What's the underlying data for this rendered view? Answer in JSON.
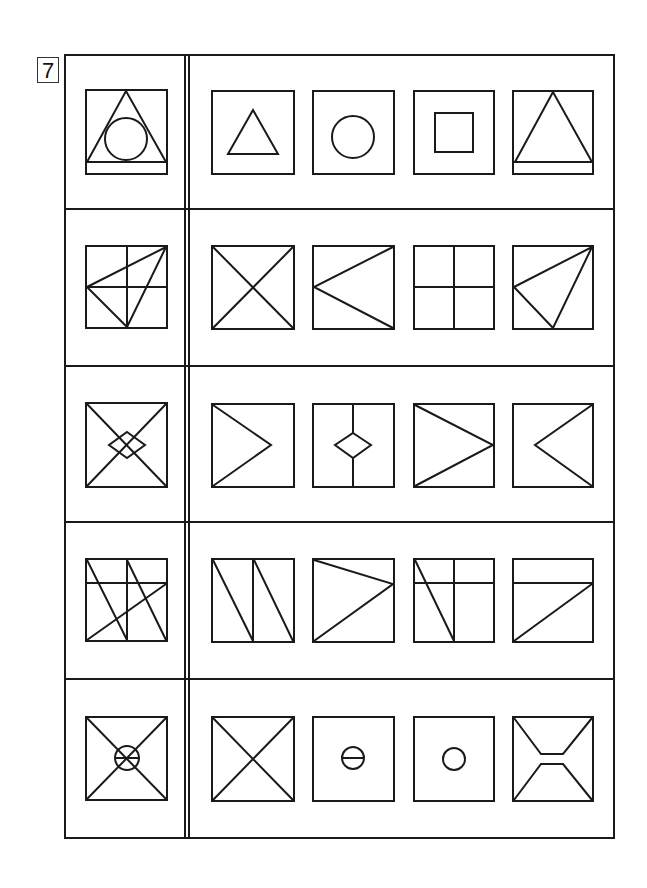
{
  "problem_number": "7",
  "layout": {
    "frame": {
      "x": 65,
      "y": 55,
      "w": 549,
      "h": 783
    },
    "divider_x": [
      185,
      189
    ],
    "row_tops": [
      55,
      209,
      366,
      522,
      679,
      838
    ],
    "stroke_color": "#1a1a1a"
  },
  "rows": [
    {
      "label": "row-1",
      "question": "triangle-with-inscribed-circle-and-base-strip",
      "options": [
        "small-triangle",
        "circle",
        "inner-square",
        "large-triangle-with-base-strip"
      ]
    },
    {
      "label": "row-2",
      "question": "quadrants-with-triangle-right-top-left-mid-bottom-mid",
      "options": [
        "diagonal-x",
        "left-pointing-v-from-left-mid",
        "quadrant-cross",
        "triangle-left-mid-top-right-bottom-mid"
      ]
    },
    {
      "label": "row-3",
      "question": "diagonal-x-with-center-diamond",
      "options": [
        "right-pointing-chevron",
        "vertical-line-with-diamond",
        "right-pointing-triangle-to-edge",
        "left-pointing-chevron"
      ]
    },
    {
      "label": "row-4",
      "question": "vertical-mid-horizontal-top-two-slashes-and-rising-diagonal",
      "options": [
        "two-parallel-slashes-with-vertical-mid",
        "triangle-to-right-upper",
        "vertical-mid-horizontal-top-slash",
        "horizontal-top-rising-diagonal"
      ]
    },
    {
      "label": "row-5",
      "question": "diagonal-x-with-center-circle-and-bar",
      "options": [
        "diagonal-x",
        "circle-with-horizontal-bar",
        "small-circle",
        "hourglass-with-flat-waist"
      ]
    }
  ]
}
